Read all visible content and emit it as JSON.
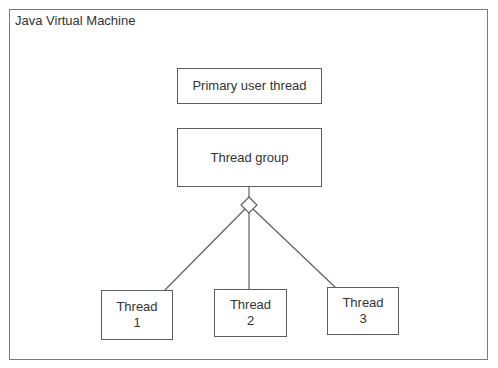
{
  "diagram": {
    "container": {
      "title": "Java Virtual Machine"
    },
    "nodes": {
      "primary_user_thread": {
        "label": "Primary user thread"
      },
      "thread_group": {
        "label": "Thread group"
      },
      "thread_1": {
        "line1": "Thread",
        "line2": "1"
      },
      "thread_2": {
        "line1": "Thread",
        "line2": "2"
      },
      "thread_3": {
        "line1": "Thread",
        "line2": "3"
      }
    },
    "edges": [
      {
        "from": "thread_group",
        "to": "thread_1",
        "type": "aggregation"
      },
      {
        "from": "thread_group",
        "to": "thread_2",
        "type": "aggregation"
      },
      {
        "from": "thread_group",
        "to": "thread_3",
        "type": "aggregation"
      }
    ],
    "colors": {
      "line": "#5e5e5e",
      "frame": "#7a7a7a",
      "text": "#333333",
      "background": "#ffffff"
    }
  }
}
